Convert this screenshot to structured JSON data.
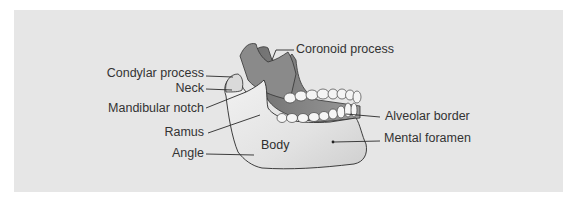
{
  "figure": {
    "background_color": "#e6e6e6",
    "bone_color": "#ececec",
    "shadow_color": "#7a7a7a",
    "line_color": "#2a2a2a"
  },
  "labels": {
    "coronoid_process": "Coronoid process",
    "condylar_process": "Condylar process",
    "neck": "Neck",
    "mandibular_notch": "Mandibular notch",
    "ramus": "Ramus",
    "angle": "Angle",
    "body": "Body",
    "alveolar_border": "Alveolar border",
    "mental_foramen": "Mental foramen"
  }
}
